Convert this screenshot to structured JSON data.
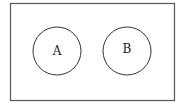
{
  "diagram": {
    "type": "venn",
    "universe": {
      "x": 10,
      "y": 3,
      "width": 164,
      "height": 97,
      "stroke": "#555555"
    },
    "sets": [
      {
        "label": "A",
        "cx": 57,
        "cy": 51,
        "r": 24,
        "stroke": "#333333"
      },
      {
        "label": "B",
        "cx": 127,
        "cy": 51,
        "r": 24,
        "stroke": "#333333"
      }
    ],
    "relationship": "disjoint"
  }
}
